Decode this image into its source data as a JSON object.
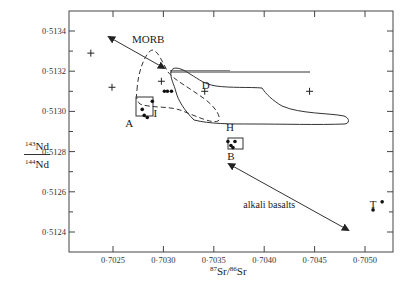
{
  "chart_data": {
    "type": "scatter",
    "title": "",
    "xlabel": "87Sr/86Sr",
    "ylabel": "143Nd/144Nd",
    "xlim": [
      0.70212,
      0.70528
    ],
    "ylim": [
      0.5123,
      0.5135
    ],
    "x_ticks": [
      "0·7025",
      "0·7030",
      "0·7035",
      "0·7040",
      "0·7045",
      "0·7050"
    ],
    "y_ticks": [
      "0·5124",
      "0·5126",
      "0·5128",
      "0·5130",
      "0·5132",
      "0·5134"
    ],
    "grid": false,
    "legend": null,
    "series": [
      {
        "name": "crosses",
        "marker": "+",
        "points": [
          {
            "x": 0.70228,
            "y": 0.51329
          },
          {
            "x": 0.70249,
            "y": 0.51312
          },
          {
            "x": 0.70298,
            "y": 0.51315
          },
          {
            "x": 0.70341,
            "y": 0.5131
          },
          {
            "x": 0.70445,
            "y": 0.5131
          }
        ]
      },
      {
        "name": "group A",
        "marker": "dot",
        "points": [
          {
            "x": 0.70279,
            "y": 0.51301
          },
          {
            "x": 0.70289,
            "y": 0.51305
          },
          {
            "x": 0.70281,
            "y": 0.51298
          },
          {
            "x": 0.70284,
            "y": 0.51297
          }
        ]
      },
      {
        "name": "group I",
        "marker": "dot",
        "points": [
          {
            "x": 0.70301,
            "y": 0.5131
          },
          {
            "x": 0.70304,
            "y": 0.5131
          },
          {
            "x": 0.70308,
            "y": 0.5131
          }
        ]
      },
      {
        "name": "group B",
        "marker": "dot",
        "points": [
          {
            "x": 0.70364,
            "y": 0.51285
          },
          {
            "x": 0.70367,
            "y": 0.51283
          },
          {
            "x": 0.70371,
            "y": 0.51285
          },
          {
            "x": 0.70369,
            "y": 0.51282
          }
        ]
      },
      {
        "name": "T",
        "marker": "dot",
        "points": [
          {
            "x": 0.70508,
            "y": 0.51251
          },
          {
            "x": 0.70517,
            "y": 0.51255
          }
        ]
      }
    ],
    "annotations": [
      {
        "text": "MORB",
        "x": 0.70285,
        "y": 0.51336,
        "arrow_from": [
          0.70248,
          0.51338
        ],
        "arrow_to": [
          0.70303,
          0.5132
        ],
        "double_headed": true
      },
      {
        "text": "alkali basalts",
        "x": 0.70405,
        "y": 0.51254,
        "arrow_from": [
          0.70362,
          0.51273
        ],
        "arrow_to": [
          0.70484,
          0.51246
        ],
        "double_headed": true
      },
      {
        "text": "D",
        "x": 0.70342,
        "y": 0.51313
      },
      {
        "text": "I",
        "x": 0.70292,
        "y": 0.51299
      },
      {
        "text": "A",
        "x": 0.70266,
        "y": 0.51294
      },
      {
        "text": "H",
        "x": 0.70366,
        "y": 0.51292
      },
      {
        "text": "B",
        "x": 0.70367,
        "y": 0.51278
      },
      {
        "text": "T",
        "x": 0.70508,
        "y": 0.51254
      }
    ]
  },
  "labels": {
    "y_num_sup": "143",
    "y_num": "Nd",
    "y_den_sup": "144",
    "y_den": "Nd",
    "x_sup1": "87",
    "x_sr1": "Sr/",
    "x_sup2": "86",
    "x_sr2": "Sr"
  }
}
